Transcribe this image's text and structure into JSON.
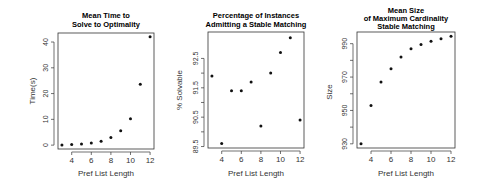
{
  "chart_data": [
    {
      "type": "scatter",
      "title": "Mean Time to\nSolve to Optimality",
      "title_lines": [
        "Mean Time to",
        "Solve to Optimality"
      ],
      "xlabel": "Pref List Length",
      "ylabel": "Time(s)",
      "x": [
        3,
        4,
        5,
        6,
        7,
        8,
        9,
        10,
        11,
        12
      ],
      "y": [
        0.1,
        0.2,
        0.4,
        0.8,
        1.5,
        3.0,
        5.6,
        10.2,
        23.6,
        42.0
      ],
      "xticks": [
        4,
        6,
        8,
        10,
        12
      ],
      "yticks": [
        0,
        10,
        20,
        30,
        40
      ],
      "xlim": [
        2.6,
        12.4
      ],
      "ylim": [
        -1.5,
        43.5
      ],
      "grid": false,
      "legend": null
    },
    {
      "type": "scatter",
      "title": "Percentage of Instances\nAdmitting a Stable Matching",
      "title_lines": [
        "Percentage of Instances",
        "Admitting a Stable Matching"
      ],
      "xlabel": "Pref List Length",
      "ylabel": "% Solvable",
      "x": [
        3,
        4,
        5,
        6,
        7,
        8,
        9,
        10,
        11,
        12
      ],
      "y": [
        91.9,
        89.6,
        91.4,
        91.4,
        91.7,
        90.2,
        92.0,
        92.7,
        93.2,
        90.4
      ],
      "xticks": [
        4,
        6,
        8,
        10,
        12
      ],
      "yticks": [
        89.5,
        90.5,
        91.5,
        92.5
      ],
      "yticks_minor": [
        90.0,
        91.0,
        92.0
      ],
      "xlim": [
        2.6,
        12.4
      ],
      "ylim": [
        89.45,
        93.4
      ],
      "grid": false,
      "legend": null
    },
    {
      "type": "scatter",
      "title": "Mean Size\nof Maximum Cardinality\nStable Matching",
      "title_lines": [
        "Mean Size",
        "of Maximum Cardinality",
        "Stable Matching"
      ],
      "xlabel": "Pref List Length",
      "ylabel": "Size",
      "x": [
        3,
        4,
        5,
        6,
        7,
        8,
        9,
        10,
        11,
        12
      ],
      "y": [
        930,
        953,
        967,
        975,
        982,
        987,
        989.5,
        991.5,
        993,
        994.5
      ],
      "xticks": [
        4,
        6,
        8,
        10,
        12
      ],
      "yticks": [
        930,
        950,
        970,
        990
      ],
      "yticks_minor": [
        940,
        960,
        980
      ],
      "xlim": [
        2.6,
        12.4
      ],
      "ylim": [
        927.5,
        997
      ],
      "grid": false,
      "legend": null
    }
  ],
  "panels": [
    {
      "title_lines": [
        "Mean Time to",
        "Solve to Optimality"
      ],
      "xlabel": "Pref List Length",
      "ylabel": "Time(s)"
    },
    {
      "title_lines": [
        "Percentage of Instances",
        "Admitting a Stable Matching"
      ],
      "xlabel": "Pref List Length",
      "ylabel": "% Solvable"
    },
    {
      "title_lines": [
        "Mean Size",
        "of Maximum Cardinality",
        "Stable Matching"
      ],
      "xlabel": "Pref List Length",
      "ylabel": "Size"
    }
  ]
}
